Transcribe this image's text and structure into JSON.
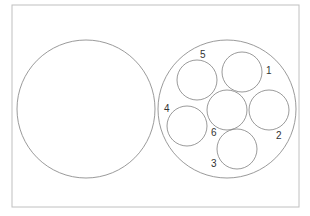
{
  "diagram": {
    "type": "circle-packing-comparison",
    "frame": {
      "x": 12,
      "y": 5,
      "width": 287,
      "height": 202,
      "stroke": "#c0c0c0"
    },
    "stroke_color": "#808080",
    "label_color": "#333333",
    "large_circle_left": {
      "cx": 86,
      "cy": 109,
      "r": 69
    },
    "large_circle_right": {
      "cx": 227,
      "cy": 109,
      "r": 69
    },
    "small_circles": [
      {
        "id": "1",
        "label": "1",
        "cx": 242,
        "cy": 72,
        "r": 20,
        "label_x": 266,
        "label_y": 74
      },
      {
        "id": "2",
        "label": "2",
        "cx": 269,
        "cy": 110,
        "r": 20,
        "label_x": 276,
        "label_y": 139
      },
      {
        "id": "3",
        "label": "3",
        "cx": 237,
        "cy": 149,
        "r": 20,
        "label_x": 211,
        "label_y": 167
      },
      {
        "id": "4",
        "label": "4",
        "cx": 187,
        "cy": 126,
        "r": 20,
        "label_x": 164,
        "label_y": 112
      },
      {
        "id": "5",
        "label": "5",
        "cx": 197,
        "cy": 80,
        "r": 20,
        "label_x": 200,
        "label_y": 58
      },
      {
        "id": "6",
        "label": "6",
        "cx": 227,
        "cy": 110,
        "r": 20,
        "label_x": 211,
        "label_y": 136
      }
    ]
  }
}
